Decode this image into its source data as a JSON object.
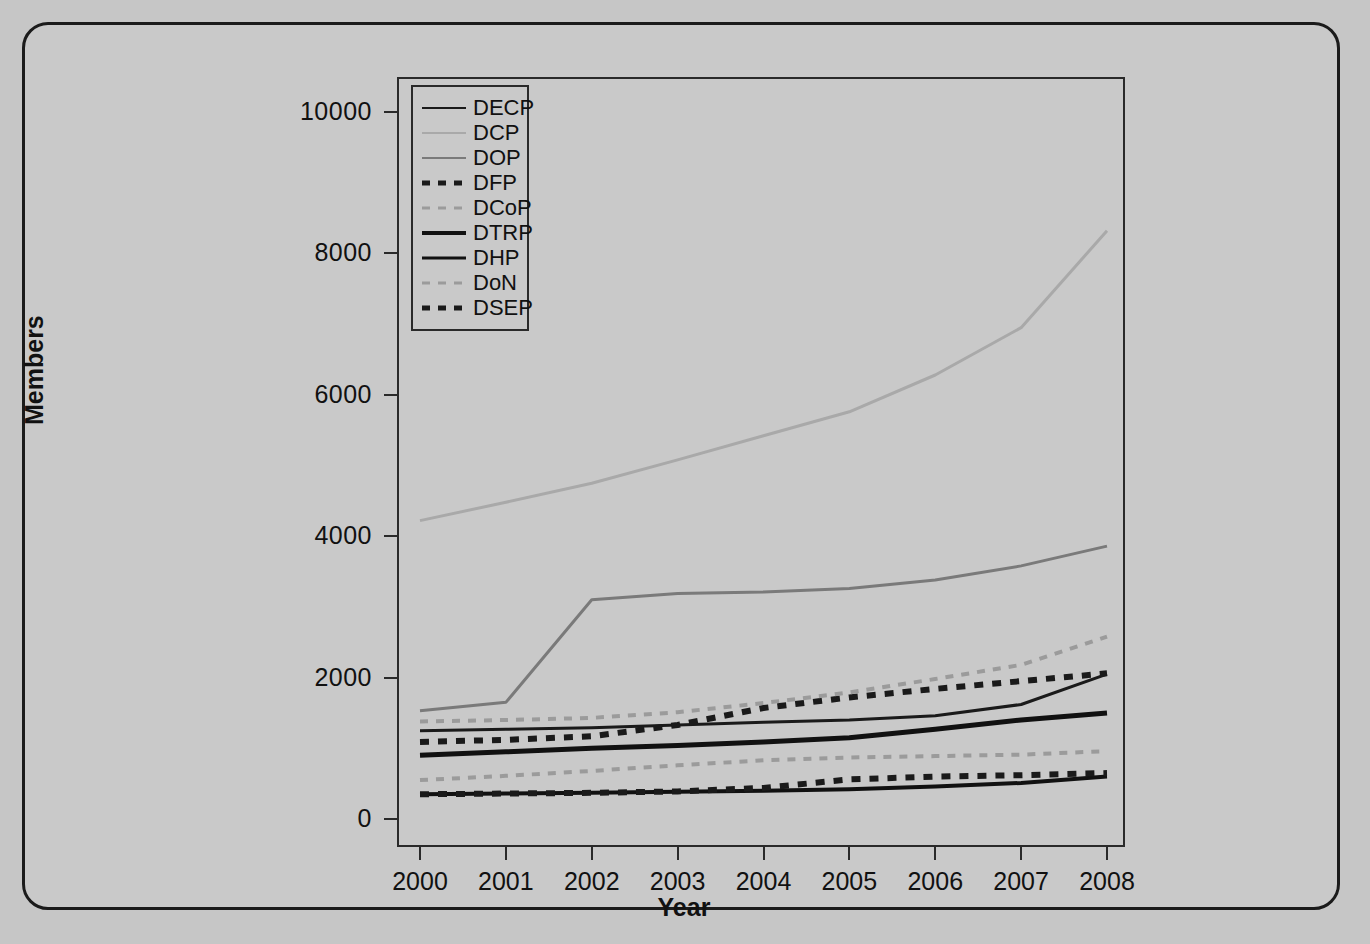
{
  "chart_data": {
    "type": "line",
    "title": "",
    "xlabel": "Year",
    "ylabel": "Members",
    "x": [
      2000,
      2001,
      2002,
      2003,
      2004,
      2005,
      2006,
      2007,
      2008
    ],
    "xtick_labels": [
      "2000",
      "2001",
      "2002",
      "2003",
      "2004",
      "2005",
      "2006",
      "2007",
      "2008"
    ],
    "ytick_labels": [
      "0",
      "2000",
      "4000",
      "6000",
      "8000",
      "10000"
    ],
    "yticks": [
      0,
      2000,
      4000,
      6000,
      8000,
      10000
    ],
    "xlim": [
      2000,
      2008
    ],
    "ylim": [
      0,
      10000
    ],
    "grid": false,
    "legend_position": "top-left inside axes",
    "series": [
      {
        "name": "DECP",
        "style": "solid",
        "color": "#1a1a1a",
        "width": 3,
        "values": [
          1250,
          1270,
          1290,
          1330,
          1370,
          1400,
          1460,
          1620,
          2050
        ]
      },
      {
        "name": "DCP",
        "style": "solid",
        "color": "#a9a9a9",
        "width": 3,
        "values": [
          4220,
          4480,
          4750,
          5080,
          5420,
          5760,
          6280,
          6950,
          8320
        ]
      },
      {
        "name": "DOP",
        "style": "solid",
        "color": "#7a7a7a",
        "width": 3,
        "values": [
          1530,
          1650,
          3100,
          3190,
          3210,
          3260,
          3380,
          3580,
          3860
        ]
      },
      {
        "name": "DFP",
        "style": "dashed",
        "color": "#1a1a1a",
        "width": 6,
        "values": [
          1090,
          1120,
          1170,
          1330,
          1570,
          1720,
          1840,
          1950,
          2060
        ]
      },
      {
        "name": "DCoP",
        "style": "dashed",
        "color": "#9b9b9b",
        "width": 4,
        "values": [
          1380,
          1400,
          1430,
          1510,
          1640,
          1790,
          1980,
          2180,
          2580
        ]
      },
      {
        "name": "DTRP",
        "style": "solid",
        "color": "#111111",
        "width": 5,
        "values": [
          900,
          950,
          1000,
          1040,
          1090,
          1150,
          1270,
          1400,
          1500
        ]
      },
      {
        "name": "DHP",
        "style": "solid",
        "color": "#111111",
        "width": 4,
        "values": [
          350,
          360,
          370,
          385,
          400,
          420,
          460,
          510,
          600
        ]
      },
      {
        "name": "DoN",
        "style": "dashed",
        "color": "#9b9b9b",
        "width": 4,
        "values": [
          550,
          610,
          680,
          760,
          830,
          870,
          890,
          910,
          960
        ]
      },
      {
        "name": "DSEP",
        "style": "dashed",
        "color": "#1a1a1a",
        "width": 6,
        "values": [
          350,
          360,
          370,
          390,
          440,
          560,
          600,
          620,
          650
        ]
      }
    ]
  }
}
